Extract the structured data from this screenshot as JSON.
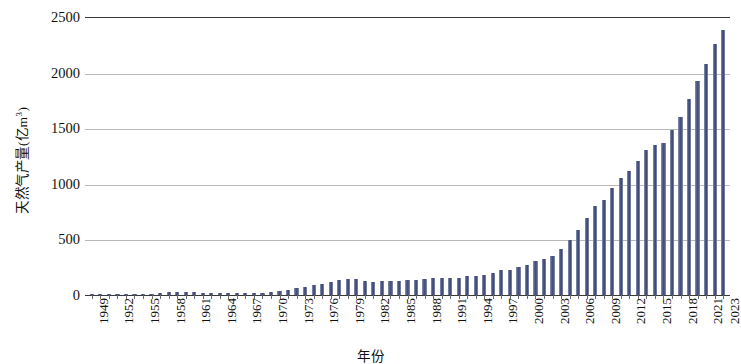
{
  "chart_data": {
    "type": "bar",
    "title": "",
    "xlabel": "年份",
    "ylabel": "天然气产量(亿m³)",
    "ylabel_main": "天然气产量(亿m",
    "ylabel_sup": "3",
    "ylabel_tail": ")",
    "ylim": [
      0,
      2500
    ],
    "ytick_step": 500,
    "yticks": [
      0,
      500,
      1000,
      1500,
      2000,
      2500
    ],
    "ytick_labels": [
      "0",
      "500",
      "1000",
      "1500",
      "2000",
      "2500"
    ],
    "grid": "horizontal",
    "legend": "none",
    "bar_color": "#4a5580",
    "axis_color": "#3a3a3a",
    "gridline_color": "#b9b9bd",
    "xtick_label_interval": 3,
    "xtick_labels": [
      "1949",
      "1952",
      "1955",
      "1958",
      "1961",
      "1964",
      "1967",
      "1970",
      "1973",
      "1976",
      "1979",
      "1982",
      "1985",
      "1988",
      "1991",
      "1994",
      "1997",
      "2000",
      "2003",
      "2006",
      "2009",
      "2012",
      "2015",
      "2018",
      "2021",
      "2023"
    ],
    "categories": [
      "1949",
      "1950",
      "1951",
      "1952",
      "1953",
      "1954",
      "1955",
      "1956",
      "1957",
      "1958",
      "1959",
      "1960",
      "1961",
      "1962",
      "1963",
      "1964",
      "1965",
      "1966",
      "1967",
      "1968",
      "1969",
      "1970",
      "1971",
      "1972",
      "1973",
      "1974",
      "1975",
      "1976",
      "1977",
      "1978",
      "1979",
      "1980",
      "1981",
      "1982",
      "1983",
      "1984",
      "1985",
      "1986",
      "1987",
      "1988",
      "1989",
      "1990",
      "1991",
      "1992",
      "1993",
      "1994",
      "1995",
      "1996",
      "1997",
      "1998",
      "1999",
      "2000",
      "2001",
      "2002",
      "2003",
      "2004",
      "2005",
      "2006",
      "2007",
      "2008",
      "2009",
      "2010",
      "2011",
      "2012",
      "2013",
      "2014",
      "2015",
      "2016",
      "2017",
      "2018",
      "2019",
      "2020",
      "2021",
      "2022",
      "2023"
    ],
    "values": [
      1,
      1,
      2,
      3,
      4,
      6,
      8,
      12,
      17,
      27,
      30,
      26,
      23,
      20,
      20,
      22,
      22,
      19,
      16,
      17,
      20,
      29,
      38,
      47,
      59,
      72,
      88,
      103,
      121,
      137,
      145,
      143,
      127,
      119,
      122,
      124,
      129,
      137,
      139,
      143,
      150,
      153,
      153,
      157,
      167,
      175,
      179,
      201,
      227,
      223,
      252,
      272,
      303,
      327,
      350,
      415,
      493,
      586,
      693,
      803,
      853,
      958,
      1053,
      1117,
      1209,
      1302,
      1350,
      1369,
      1480,
      1603,
      1762,
      1925,
      2076,
      2253,
      2380
    ]
  }
}
